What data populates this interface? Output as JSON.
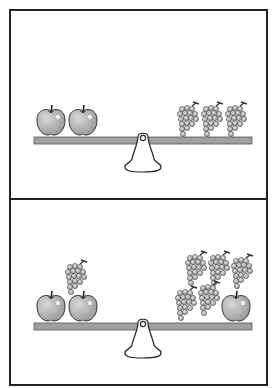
{
  "puzzle": {
    "type": "balance-scale",
    "panels": [
      {
        "id": "top",
        "state": "balanced",
        "left_pan": {
          "apple": 2,
          "grapes": 0
        },
        "right_pan": {
          "apple": 0,
          "grapes": 3
        }
      },
      {
        "id": "bottom",
        "state": "balanced",
        "left_pan": {
          "apple": 2,
          "grapes": 1
        },
        "right_pan": {
          "apple": 1,
          "grapes": 5
        }
      }
    ]
  },
  "colors": {
    "border": "#222222",
    "beam": "#a0a0a0",
    "fruit_fill": "#a8a8a8",
    "outline": "#333333",
    "background": "#ffffff"
  },
  "icons": [
    "apple-icon",
    "grapes-icon",
    "fulcrum-icon",
    "beam"
  ]
}
